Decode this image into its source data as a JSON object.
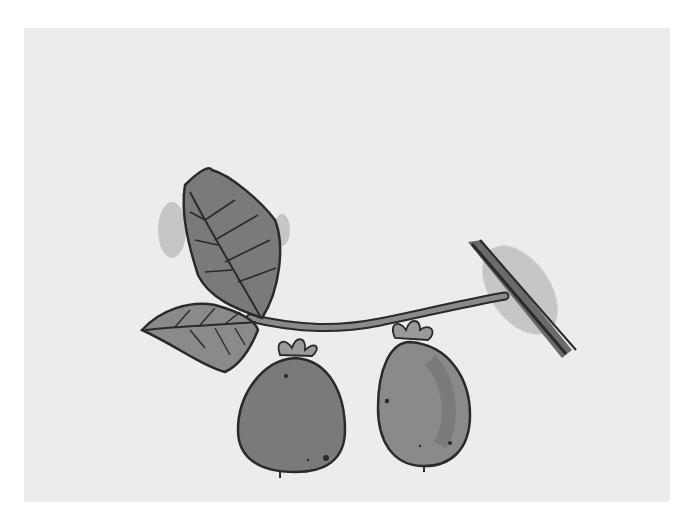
{
  "image": {
    "subject": "Watercolor and ink drawing of a kiwi fruit branch",
    "elements": [
      "branch",
      "two leaves",
      "two hanging kiwi fruits",
      "cut twig end"
    ],
    "palette": {
      "background_margin": "#ffffff",
      "paper": "#ececec",
      "wash_dark": "#6e6e6e",
      "wash_mid": "#8a8a8a",
      "wash_light": "#a8a8a8",
      "ink": "#2a2a2a"
    }
  }
}
